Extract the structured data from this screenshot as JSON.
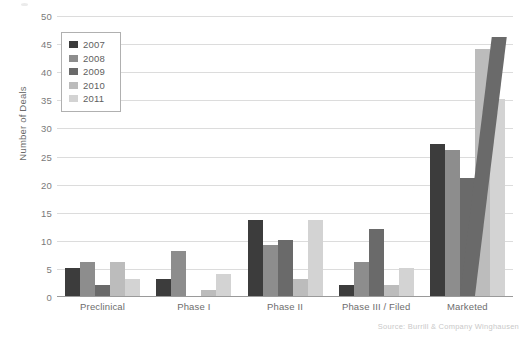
{
  "chart_data": {
    "type": "bar",
    "title": "",
    "subtitle": "",
    "xlabel": "",
    "ylabel": "Number of Deals",
    "ylim": [
      0,
      50
    ],
    "ytick_step": 5,
    "yticks": [
      50,
      45,
      40,
      35,
      30,
      25,
      20,
      15,
      10,
      5,
      0
    ],
    "grid": true,
    "legend_position": "top-left",
    "categories": [
      "Preclinical",
      "Phase I",
      "Phase II",
      "Phase III / Filed",
      "Marketed"
    ],
    "series": [
      {
        "name": "2007",
        "color": "#3c3c3c",
        "values": [
          5,
          3,
          13.5,
          2,
          27
        ]
      },
      {
        "name": "2008",
        "color": "#8d8d8d",
        "values": [
          6,
          8,
          9,
          6,
          26
        ]
      },
      {
        "name": "2009",
        "color": "#6a6a6a",
        "values": [
          2,
          0,
          10,
          12,
          21
        ]
      },
      {
        "name": "2010",
        "color": "#bcbcbc",
        "values": [
          6,
          1,
          3,
          2,
          44
        ]
      },
      {
        "name": "2011",
        "color": "#d3d3d3",
        "values": [
          3,
          4,
          13.5,
          5,
          35
        ]
      }
    ],
    "annotations": [
      {
        "name": "scan-artifact-skewed-bar",
        "category": "Marketed",
        "series": "2009",
        "value": 46,
        "note": "tilted duplicate bar from page scan"
      }
    ],
    "source": "Source: Burrill & Company Winghausen"
  }
}
